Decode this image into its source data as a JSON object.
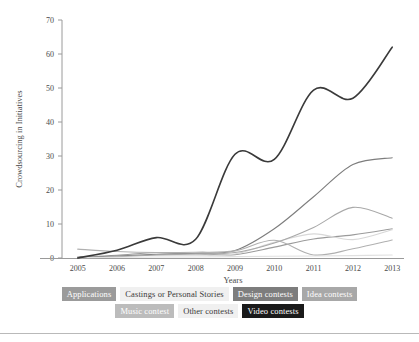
{
  "chart_data": {
    "type": "line",
    "title": "",
    "xlabel": "Years",
    "ylabel": "Crowdsourcing in Initiatives",
    "categories": [
      "2005",
      "2006",
      "2007",
      "2008",
      "2009",
      "2010",
      "2011",
      "2012",
      "2013"
    ],
    "x": [
      2005,
      2006,
      2007,
      2008,
      2009,
      2010,
      2011,
      2012,
      2013
    ],
    "xlim": [
      2004.6,
      2013.3
    ],
    "ylim": [
      0,
      70
    ],
    "yticks": [
      0,
      10,
      20,
      30,
      40,
      50,
      60,
      70
    ],
    "ytick_labels": [
      "0",
      "10",
      "20",
      "30",
      "40",
      "50",
      "60",
      "70"
    ],
    "grid": false,
    "legend_position": "bottom",
    "smoothing": "spline",
    "series": [
      {
        "name": "Applications",
        "color": "#9b9b9b",
        "values": [
          0.3,
          0.8,
          1.6,
          1.3,
          1.0,
          3.2,
          5.6,
          6.8,
          8.6
        ]
      },
      {
        "name": "Castings or Personal Stories",
        "color": "#d8d8d8",
        "values": [
          0.2,
          0.5,
          0.9,
          0.8,
          1.2,
          4.6,
          7.1,
          5.4,
          8.3
        ]
      },
      {
        "name": "Design contests",
        "color": "#7d7d7d",
        "values": [
          0.2,
          0.6,
          1.1,
          1.4,
          2.2,
          8.6,
          18.0,
          27.5,
          29.5
        ]
      },
      {
        "name": "Idea contests",
        "color": "#a8a8a8",
        "values": [
          0.1,
          0.4,
          0.9,
          1.2,
          1.6,
          4.4,
          9.0,
          14.9,
          11.7
        ]
      },
      {
        "name": "Music contest",
        "color": "#b0b0b0",
        "values": [
          2.6,
          1.9,
          1.6,
          1.7,
          2.1,
          5.2,
          0.9,
          2.7,
          5.3
        ]
      },
      {
        "name": "Other contests",
        "color": "#e0e0e0",
        "values": [
          0.1,
          0.2,
          0.3,
          0.3,
          0.4,
          0.5,
          0.6,
          0.7,
          0.9
        ]
      },
      {
        "name": "Video contests",
        "color": "#3a3a3a",
        "values": [
          0.0,
          2.3,
          6.0,
          5.5,
          30.5,
          29.0,
          49.4,
          47.0,
          62.0
        ]
      }
    ]
  },
  "legend": {
    "rows": [
      [
        {
          "label": "Applications",
          "bg": "#9b9b9b",
          "fg": "#ffffff"
        },
        {
          "label": "Castings or Personal Stories",
          "bg": "#f0f0f0",
          "fg": "#3a3a3a"
        },
        {
          "label": "Design contests",
          "bg": "#7d7d7d",
          "fg": "#ffffff"
        },
        {
          "label": "Idea contests",
          "bg": "#a8a8a8",
          "fg": "#ffffff"
        }
      ],
      [
        {
          "label": "Music contest",
          "bg": "#bcbcbc",
          "fg": "#ffffff"
        },
        {
          "label": "Other contests",
          "bg": "#f0f0f0",
          "fg": "#3a3a3a"
        },
        {
          "label": "Video contests",
          "bg": "#1a1a1a",
          "fg": "#ffffff"
        }
      ]
    ]
  },
  "axes": {
    "y_title": "Crowdsourcing in Initiatives",
    "x_title": "Years"
  }
}
